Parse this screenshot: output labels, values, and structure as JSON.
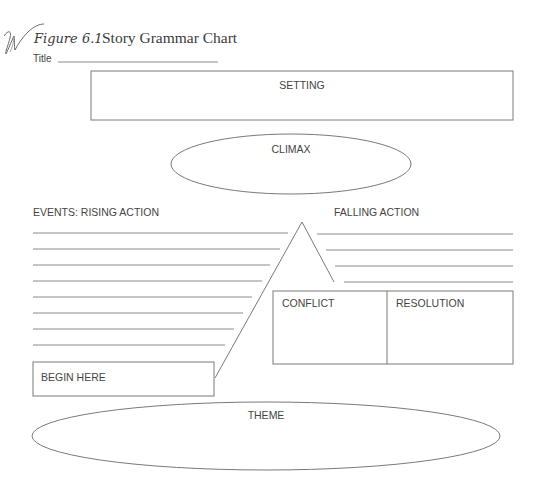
{
  "figure": {
    "label": "Figure 6.1",
    "title": "Story Grammar Chart",
    "accent_color": "#7a7a7a"
  },
  "title_field": {
    "label": "Title",
    "value": ""
  },
  "setting": {
    "label": "SETTING",
    "value": ""
  },
  "climax": {
    "label": "CLIMAX",
    "value": ""
  },
  "rising_action": {
    "label": "EVENTS: RISING ACTION",
    "lines": [
      {
        "y": 233,
        "x1": 33,
        "x2": 288,
        "value": ""
      },
      {
        "y": 249,
        "x1": 33,
        "x2": 280,
        "value": ""
      },
      {
        "y": 265,
        "x1": 33,
        "x2": 270,
        "value": ""
      },
      {
        "y": 281,
        "x1": 33,
        "x2": 262,
        "value": ""
      },
      {
        "y": 297,
        "x1": 33,
        "x2": 252,
        "value": ""
      },
      {
        "y": 313,
        "x1": 33,
        "x2": 243,
        "value": ""
      },
      {
        "y": 329,
        "x1": 33,
        "x2": 234,
        "value": ""
      },
      {
        "y": 345,
        "x1": 33,
        "x2": 225,
        "value": ""
      }
    ]
  },
  "falling_action": {
    "label": "FALLING ACTION",
    "lines": [
      {
        "y": 234,
        "x1": 317,
        "x2": 513,
        "value": ""
      },
      {
        "y": 250,
        "x1": 326,
        "x2": 513,
        "value": ""
      },
      {
        "y": 266,
        "x1": 335,
        "x2": 513,
        "value": ""
      },
      {
        "y": 282,
        "x1": 344,
        "x2": 513,
        "value": ""
      }
    ]
  },
  "conflict": {
    "label": "CONFLICT",
    "value": ""
  },
  "resolution": {
    "label": "RESOLUTION",
    "value": ""
  },
  "begin_here": {
    "label": "BEGIN HERE",
    "value": ""
  },
  "theme": {
    "label": "THEME",
    "value": ""
  }
}
